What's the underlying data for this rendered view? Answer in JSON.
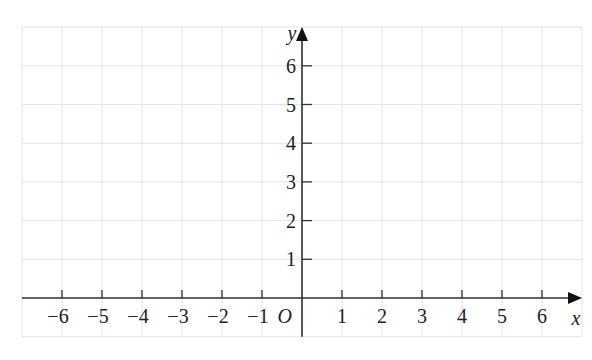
{
  "chart_data": {
    "type": "coordinate-grid",
    "title": "",
    "xlabel": "x",
    "ylabel": "y",
    "origin_label": "O",
    "x_ticks": [
      -6,
      -5,
      -4,
      -3,
      -2,
      -1,
      1,
      2,
      3,
      4,
      5,
      6
    ],
    "y_ticks": [
      1,
      2,
      3,
      4,
      5,
      6
    ],
    "xlim": [
      -7,
      7
    ],
    "ylim": [
      -1,
      7
    ],
    "grid": true,
    "data": []
  },
  "colors": {
    "grid": "#e3e3e3",
    "axis": "#333333",
    "text": "#222222",
    "background": "#ffffff"
  },
  "layout": {
    "origin_px": [
      302,
      298
    ],
    "unit_x_px": 40,
    "unit_y_px": 38.7
  }
}
